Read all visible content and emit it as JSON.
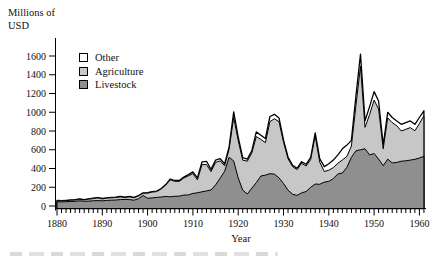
{
  "labels": {
    "y_axis_line1": "Millions of",
    "y_axis_line2": "USD",
    "x_axis": "Year"
  },
  "chart_data": {
    "type": "area",
    "stacked": true,
    "title": "",
    "xlabel": "Year",
    "ylabel": "Millions of USD",
    "xlim": [
      1880,
      1962
    ],
    "ylim": [
      0,
      1700
    ],
    "grid": false,
    "legend_position": "upper-left-inside",
    "x_ticks": [
      1880,
      1890,
      1900,
      1910,
      1920,
      1930,
      1940,
      1950,
      1960
    ],
    "y_ticks": [
      0,
      200,
      400,
      600,
      800,
      1000,
      1200,
      1400,
      1600
    ],
    "legend": [
      {
        "label": "Other",
        "color": "#ffffff"
      },
      {
        "label": "Agriculture",
        "color": "#c7c7c7"
      },
      {
        "label": "Livestock",
        "color": "#8f8f8f"
      }
    ],
    "axis_color": "#000000",
    "outline_color": "#000000",
    "years": [
      1880,
      1881,
      1882,
      1883,
      1884,
      1885,
      1886,
      1887,
      1888,
      1889,
      1890,
      1891,
      1892,
      1893,
      1894,
      1895,
      1896,
      1897,
      1898,
      1899,
      1900,
      1901,
      1902,
      1903,
      1904,
      1905,
      1906,
      1907,
      1908,
      1909,
      1910,
      1911,
      1912,
      1913,
      1914,
      1915,
      1916,
      1917,
      1918,
      1919,
      1920,
      1921,
      1922,
      1923,
      1924,
      1925,
      1926,
      1927,
      1928,
      1929,
      1930,
      1931,
      1932,
      1933,
      1934,
      1935,
      1936,
      1937,
      1938,
      1939,
      1940,
      1941,
      1942,
      1943,
      1944,
      1945,
      1946,
      1947,
      1948,
      1949,
      1950,
      1951,
      1952,
      1953,
      1954,
      1955,
      1956,
      1957,
      1958,
      1959,
      1960,
      1961
    ],
    "series": [
      {
        "name": "Livestock",
        "color": "#8f8f8f",
        "values": [
          45,
          44,
          46,
          48,
          50,
          55,
          50,
          52,
          55,
          58,
          56,
          60,
          62,
          64,
          68,
          70,
          68,
          62,
          78,
          112,
          82,
          86,
          92,
          96,
          102,
          98,
          104,
          106,
          116,
          118,
          134,
          141,
          152,
          161,
          171,
          225,
          296,
          370,
          520,
          480,
          300,
          170,
          128,
          190,
          250,
          320,
          330,
          345,
          340,
          300,
          240,
          170,
          125,
          113,
          140,
          155,
          200,
          235,
          232,
          255,
          262,
          292,
          342,
          352,
          413,
          520,
          590,
          600,
          610,
          545,
          560,
          500,
          430,
          500,
          460,
          465,
          478,
          482,
          490,
          498,
          512,
          530
        ]
      },
      {
        "name": "Agriculture",
        "color": "#c7c7c7",
        "values": [
          12,
          11,
          12,
          13,
          14,
          17,
          15,
          21,
          24,
          28,
          20,
          24,
          26,
          27,
          29,
          21,
          29,
          26,
          30,
          24,
          55,
          62,
          62,
          85,
          120,
          182,
          160,
          158,
          182,
          203,
          212,
          139,
          290,
          281,
          196,
          240,
          185,
          60,
          85,
          465,
          400,
          320,
          350,
          375,
          490,
          390,
          345,
          555,
          590,
          600,
          440,
          335,
          295,
          275,
          315,
          272,
          296,
          513,
          237,
          113,
          120,
          118,
          113,
          140,
          115,
          120,
          490,
          890,
          230,
          430,
          570,
          535,
          180,
          440,
          430,
          390,
          322,
          336,
          346,
          304,
          368,
          432
        ]
      },
      {
        "name": "Other",
        "color": "#ffffff",
        "values": [
          3,
          3,
          3,
          3,
          3,
          3,
          3,
          3,
          4,
          4,
          4,
          4,
          4,
          4,
          4,
          4,
          4,
          4,
          4,
          4,
          5,
          5,
          5,
          6,
          6,
          8,
          8,
          8,
          10,
          14,
          18,
          20,
          28,
          35,
          23,
          25,
          24,
          20,
          25,
          60,
          35,
          25,
          22,
          25,
          50,
          45,
          45,
          55,
          48,
          40,
          25,
          18,
          15,
          14,
          18,
          18,
          24,
          32,
          36,
          52,
          68,
          80,
          90,
          118,
          122,
          60,
          100,
          130,
          70,
          85,
          90,
          85,
          40,
          60,
          54,
          53,
          72,
          72,
          72,
          70,
          64,
          54
        ]
      }
    ]
  }
}
